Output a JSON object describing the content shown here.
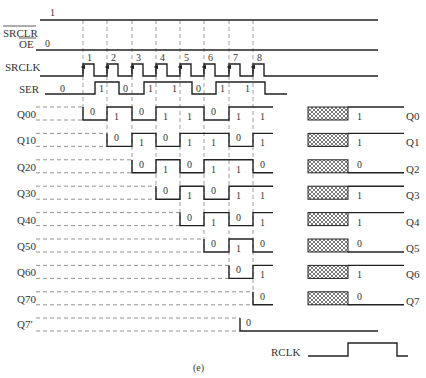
{
  "caption": "(e)",
  "colors": {
    "line": "#222222",
    "text": "#333333",
    "hatch": "#555555",
    "background": "#ffffff"
  },
  "clock_edges_x": [
    83,
    107,
    132,
    156,
    180,
    204,
    229,
    253
  ],
  "signals": {
    "srclr": {
      "label": "SRCLR",
      "level_label": "1",
      "overbar": true
    },
    "oe": {
      "label": "OE",
      "level_label": "0",
      "overbar": true
    },
    "srclk": {
      "label": "SRCLK",
      "pulse_numbers": [
        "1",
        "2",
        "3",
        "4",
        "5",
        "6",
        "7",
        "8"
      ]
    },
    "ser": {
      "label": "SER",
      "values": [
        "0",
        "1",
        "0",
        "1",
        "1",
        "0",
        "1",
        "1"
      ]
    },
    "rclk": {
      "label": "RCLK"
    }
  },
  "shift_stages": [
    {
      "label": "Q00",
      "values": [
        "0",
        "1",
        "0",
        "1",
        "1",
        "0",
        "1",
        "1"
      ],
      "final": "1"
    },
    {
      "label": "Q10",
      "values": [
        "0",
        "1",
        "0",
        "1",
        "1",
        "0",
        "1"
      ],
      "final": "1"
    },
    {
      "label": "Q20",
      "values": [
        "0",
        "1",
        "0",
        "1",
        "1",
        "0"
      ],
      "final": "0"
    },
    {
      "label": "Q30",
      "values": [
        "0",
        "1",
        "0",
        "1",
        "1"
      ],
      "final": "1"
    },
    {
      "label": "Q40",
      "values": [
        "0",
        "1",
        "0",
        "1"
      ],
      "final": "1"
    },
    {
      "label": "Q50",
      "values": [
        "0",
        "1",
        "0"
      ],
      "final": "0"
    },
    {
      "label": "Q60",
      "values": [
        "0",
        "1"
      ],
      "final": "1"
    },
    {
      "label": "Q70",
      "values": [
        "0"
      ],
      "final": "0"
    }
  ],
  "q7_prime": {
    "label": "Q7′",
    "value": "0"
  },
  "outputs": [
    {
      "label": "Q0",
      "value": "1"
    },
    {
      "label": "Q1",
      "value": "1"
    },
    {
      "label": "Q2",
      "value": "0"
    },
    {
      "label": "Q3",
      "value": "1"
    },
    {
      "label": "Q4",
      "value": "1"
    },
    {
      "label": "Q5",
      "value": "0"
    },
    {
      "label": "Q6",
      "value": "1"
    },
    {
      "label": "Q7",
      "value": "0"
    }
  ]
}
